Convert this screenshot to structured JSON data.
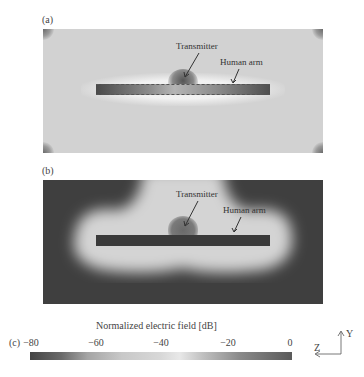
{
  "figure": {
    "panels": [
      {
        "label": "(a)",
        "annotations": {
          "transmitter": "Transmitter",
          "human_arm": "Human arm"
        }
      },
      {
        "label": "(b)",
        "annotations": {
          "transmitter": "Transmitter",
          "human_arm": "Human arm"
        }
      }
    ],
    "colorbar": {
      "label": "(c)",
      "title": "Normalized electric field [dB]",
      "ticks": [
        "−80",
        "−60",
        "−40",
        "−20",
        "0"
      ],
      "min": -80,
      "max": 0
    },
    "axes": {
      "vertical": "Y",
      "horizontal": "Z"
    }
  }
}
